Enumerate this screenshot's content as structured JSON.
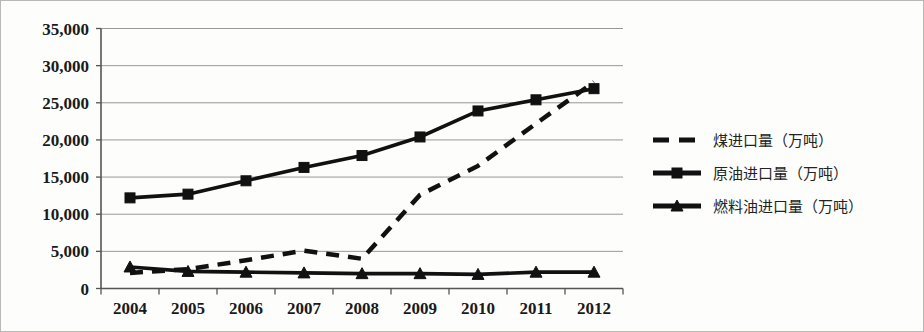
{
  "chart_data": {
    "type": "line",
    "title": "",
    "xlabel": "",
    "ylabel": "",
    "categories": [
      "2004",
      "2005",
      "2006",
      "2007",
      "2008",
      "2009",
      "2010",
      "2011",
      "2012"
    ],
    "ylim": [
      0,
      35000
    ],
    "ytick_labels": [
      "0",
      "5,000",
      "10,000",
      "15,000",
      "20,000",
      "25,000",
      "30,000",
      "35,000"
    ],
    "ytick_values": [
      0,
      5000,
      10000,
      15000,
      20000,
      25000,
      30000,
      35000
    ],
    "grid": true,
    "legend_position": "right",
    "series": [
      {
        "name": "煤进口量（万吨）",
        "style": "dashed",
        "marker": "none",
        "color": "#111111",
        "values": [
          2100,
          2600,
          3800,
          5100,
          4000,
          12600,
          16500,
          22200,
          27800
        ]
      },
      {
        "name": "原油进口量（万吨）",
        "style": "solid",
        "marker": "square",
        "color": "#111111",
        "values": [
          12200,
          12700,
          14500,
          16300,
          17900,
          20400,
          23900,
          25400,
          26900
        ]
      },
      {
        "name": "燃料油进口量（万吨）",
        "style": "solid",
        "marker": "triangle",
        "color": "#111111",
        "values": [
          2900,
          2300,
          2200,
          2100,
          2000,
          2000,
          1900,
          2200,
          2200
        ]
      }
    ]
  },
  "legend": {
    "items": [
      {
        "label": "煤进口量（万吨）"
      },
      {
        "label": "原油进口量（万吨）"
      },
      {
        "label": "燃料油进口量（万吨）"
      }
    ]
  }
}
